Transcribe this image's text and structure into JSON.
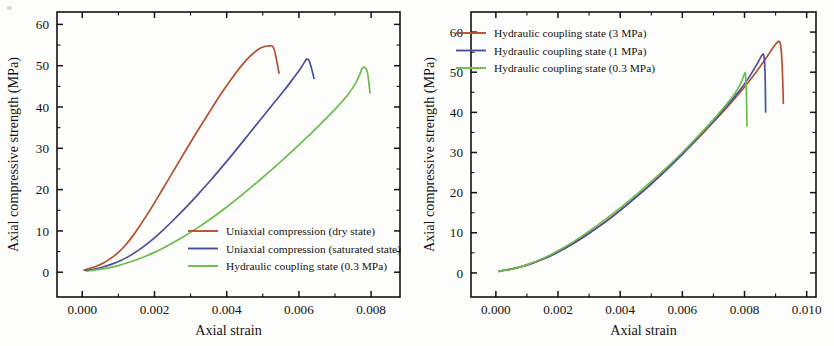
{
  "figure": {
    "name": "stress-strain-comparison-figure",
    "background": "#fdfdfc"
  },
  "colors": {
    "series_red": "#b5512f",
    "series_blue": "#4a4f9e",
    "series_green": "#6cbe4c",
    "axis": "#15120f",
    "text": "#15120f"
  },
  "chart_data": [
    {
      "type": "line",
      "panel": "left",
      "title": "",
      "xlabel": "Axial strain",
      "ylabel": "Axial compressive strength (MPa)",
      "xlim": [
        -0.0007,
        0.0088
      ],
      "ylim": [
        -6,
        63
      ],
      "xticks": [
        0.0,
        0.002,
        0.004,
        0.006,
        0.008
      ],
      "xtick_labels": [
        "0.000",
        "0.002",
        "0.004",
        "0.006",
        "0.008"
      ],
      "yticks": [
        0,
        10,
        20,
        30,
        40,
        50,
        60
      ],
      "ytick_labels": [
        "0",
        "10",
        "20",
        "30",
        "40",
        "50",
        "60"
      ],
      "minor_ticks_per_interval": 1,
      "grid": false,
      "legend_position": "center-right-inside",
      "series": [
        {
          "name": "Uniaxial compression (dry state)",
          "color": "#b5512f",
          "peak_strain": 0.00527,
          "peak_strength": 54.8,
          "end_strain": 0.00545,
          "end_strength": 48.2,
          "x": [
            5e-05,
            0.0002,
            0.0004,
            0.0006,
            0.0008,
            0.001,
            0.0012,
            0.0014,
            0.0016,
            0.0018,
            0.002,
            0.0023,
            0.0026,
            0.0029,
            0.0032,
            0.0035,
            0.0038,
            0.0041,
            0.0044,
            0.00465,
            0.0049,
            0.00508,
            0.0052,
            0.00527,
            0.00533,
            0.0054,
            0.00545
          ],
          "y": [
            0.5,
            0.9,
            1.5,
            2.3,
            3.4,
            4.8,
            6.6,
            8.8,
            11.3,
            14.0,
            16.8,
            21.2,
            25.6,
            30.0,
            34.3,
            38.5,
            42.6,
            46.4,
            49.9,
            52.3,
            54.1,
            54.7,
            54.8,
            54.7,
            53.5,
            50.5,
            48.2
          ]
        },
        {
          "name": "Uniaxial compression (saturated state)",
          "color": "#4a4f9e",
          "peak_strain": 0.00622,
          "peak_strength": 51.6,
          "end_strain": 0.00642,
          "end_strength": 46.9,
          "x": [
            0.0001,
            0.0003,
            0.00055,
            0.0008,
            0.00105,
            0.0013,
            0.0016,
            0.0019,
            0.0022,
            0.0025,
            0.00285,
            0.0032,
            0.00355,
            0.0039,
            0.00425,
            0.0046,
            0.00495,
            0.0053,
            0.0056,
            0.00585,
            0.00605,
            0.00618,
            0.00622,
            0.00628,
            0.00635,
            0.00642
          ],
          "y": [
            0.4,
            0.7,
            1.2,
            1.9,
            2.8,
            3.9,
            5.6,
            7.6,
            9.9,
            12.4,
            15.5,
            18.8,
            22.2,
            25.8,
            29.5,
            33.3,
            37.1,
            40.9,
            44.1,
            47.0,
            49.4,
            51.2,
            51.6,
            51.3,
            49.3,
            46.9
          ]
        },
        {
          "name": "Hydraulic coupling state (0.3 MPa)",
          "color": "#6cbe4c",
          "peak_strain": 0.00772,
          "peak_strength": 49.6,
          "end_strain": 0.00797,
          "end_strength": 43.4,
          "x": [
            0.00015,
            0.0004,
            0.0007,
            0.001,
            0.0013,
            0.00165,
            0.002,
            0.0024,
            0.0028,
            0.0032,
            0.0036,
            0.004,
            0.00445,
            0.0049,
            0.00535,
            0.0058,
            0.00625,
            0.00668,
            0.00705,
            0.00735,
            0.00758,
            0.0077,
            0.00775,
            0.00782,
            0.0079,
            0.00797
          ],
          "y": [
            0.3,
            0.6,
            1.0,
            1.6,
            2.4,
            3.5,
            4.8,
            6.6,
            8.6,
            10.8,
            13.2,
            15.8,
            18.9,
            22.2,
            25.6,
            29.2,
            32.9,
            36.6,
            39.9,
            42.9,
            45.9,
            48.2,
            49.3,
            49.6,
            48.3,
            43.4
          ]
        }
      ]
    },
    {
      "type": "line",
      "panel": "right",
      "title": "",
      "xlabel": "Axial strain",
      "ylabel": "Axial compressive strength (MPa)",
      "xlim": [
        -0.0008,
        0.0103
      ],
      "ylim": [
        -6,
        65
      ],
      "xticks": [
        0.0,
        0.002,
        0.004,
        0.006,
        0.008,
        0.01
      ],
      "xtick_labels": [
        "0.000",
        "0.002",
        "0.004",
        "0.006",
        "0.008",
        "0.010"
      ],
      "yticks": [
        0,
        10,
        20,
        30,
        40,
        50,
        60
      ],
      "ytick_labels": [
        "0",
        "10",
        "20",
        "30",
        "40",
        "50",
        "60"
      ],
      "minor_ticks_per_interval": 1,
      "grid": false,
      "legend_position": "top-left-inside",
      "series": [
        {
          "name": "Hydraulic coupling state (3 MPa)",
          "color": "#b5512f",
          "peak_strain": 0.00905,
          "peak_strength": 57.4,
          "end_strain": 0.00925,
          "end_strength": 42.2,
          "x": [
            0.0001,
            0.0004,
            0.0008,
            0.0012,
            0.0016,
            0.002,
            0.0025,
            0.003,
            0.0035,
            0.004,
            0.0045,
            0.005,
            0.0055,
            0.006,
            0.0065,
            0.007,
            0.0075,
            0.008,
            0.0084,
            0.0087,
            0.0089,
            0.00905,
            0.00915,
            0.00921,
            0.00925
          ],
          "y": [
            0.4,
            0.8,
            1.5,
            2.5,
            3.7,
            5.2,
            7.4,
            9.9,
            12.6,
            15.6,
            18.8,
            22.2,
            25.8,
            29.6,
            33.5,
            37.6,
            41.8,
            46.3,
            50.3,
            53.6,
            55.9,
            57.4,
            57.2,
            52.0,
            42.2
          ]
        },
        {
          "name": "Hydraulic coupling state (1 MPa)",
          "color": "#4a4f9e",
          "peak_strain": 0.00855,
          "peak_strength": 54.2,
          "end_strain": 0.00868,
          "end_strength": 40.1,
          "x": [
            0.0001,
            0.0004,
            0.0008,
            0.0012,
            0.0016,
            0.002,
            0.0025,
            0.003,
            0.0035,
            0.004,
            0.0045,
            0.005,
            0.0055,
            0.006,
            0.0065,
            0.007,
            0.0075,
            0.0079,
            0.0082,
            0.00843,
            0.00855,
            0.00862,
            0.00866,
            0.00868
          ],
          "y": [
            0.4,
            0.8,
            1.5,
            2.5,
            3.7,
            5.2,
            7.4,
            9.9,
            12.6,
            15.6,
            18.8,
            22.2,
            25.8,
            29.6,
            33.6,
            37.8,
            42.2,
            46.0,
            49.4,
            52.4,
            54.1,
            54.2,
            50.0,
            40.1
          ]
        },
        {
          "name": "Hydraulic coupling state (0.3 MPa)",
          "color": "#6cbe4c",
          "peak_strain": 0.008,
          "peak_strength": 49.6,
          "end_strain": 0.00808,
          "end_strength": 36.6,
          "x": [
            0.0001,
            0.0004,
            0.0008,
            0.0012,
            0.0016,
            0.002,
            0.0025,
            0.003,
            0.0035,
            0.004,
            0.0045,
            0.005,
            0.0055,
            0.006,
            0.0065,
            0.007,
            0.0074,
            0.0077,
            0.00788,
            0.00798,
            0.00803,
            0.00806,
            0.00808
          ],
          "y": [
            0.4,
            0.8,
            1.5,
            2.6,
            3.9,
            5.5,
            7.8,
            10.4,
            13.2,
            16.2,
            19.4,
            22.8,
            26.3,
            30.0,
            34.0,
            38.2,
            41.8,
            44.8,
            47.2,
            49.2,
            49.6,
            45.0,
            36.6
          ]
        }
      ]
    }
  ]
}
